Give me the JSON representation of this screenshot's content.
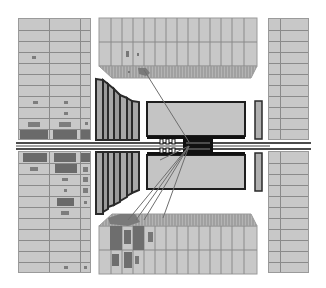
{
  "diagram": {
    "type": "particle-detector-event-display",
    "view": "longitudinal cross-section",
    "colors": {
      "background": "#ffffff",
      "muon_chamber_fill": "#c8c8c8",
      "grid_line": "#8a8a8a",
      "hit_fill": "#7d7d7d",
      "detector_outline": "#1e1e1e",
      "calorimeter_fill": "#c4c4c4",
      "track_line": "#6e6e6e"
    },
    "components": [
      {
        "id": "left-muon-barrel-top",
        "rows": 11,
        "cols": 3
      },
      {
        "id": "left-muon-barrel-bottom",
        "rows": 11,
        "cols": 3
      },
      {
        "id": "right-muon-barrel-top",
        "rows": 11,
        "cols": 2
      },
      {
        "id": "right-muon-barrel-bottom",
        "rows": 11,
        "cols": 2
      },
      {
        "id": "top-muon-endcap",
        "cols": 10,
        "rows": 2
      },
      {
        "id": "bottom-muon-endcap",
        "cols": 10,
        "rows": 2
      },
      {
        "id": "left-forward-calorimeter-top",
        "slabs": 5
      },
      {
        "id": "left-forward-calorimeter-bottom",
        "slabs": 5
      },
      {
        "id": "central-calorimeter-top"
      },
      {
        "id": "central-calorimeter-bottom"
      },
      {
        "id": "right-endcap-top"
      },
      {
        "id": "right-endcap-bottom"
      },
      {
        "id": "beam-pipe"
      },
      {
        "id": "inner-tracker"
      }
    ],
    "tracks": [
      {
        "from": [
          189,
          142
        ],
        "to": [
          144,
          70
        ]
      },
      {
        "from": [
          189,
          146
        ],
        "to": [
          128,
          222
        ]
      },
      {
        "from": [
          189,
          146
        ],
        "to": [
          138,
          222
        ]
      },
      {
        "from": [
          189,
          146
        ],
        "to": [
          148,
          222
        ]
      },
      {
        "from": [
          189,
          146
        ],
        "to": [
          165,
          222
        ]
      },
      {
        "from": [
          189,
          146
        ],
        "to": [
          160,
          160
        ]
      }
    ]
  }
}
